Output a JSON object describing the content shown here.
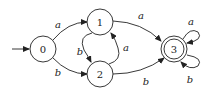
{
  "diagram": {
    "type": "finite-automaton",
    "start_state": "0",
    "accepting_states": [
      "3"
    ],
    "nodes": [
      {
        "id": "0",
        "label": "0"
      },
      {
        "id": "1",
        "label": "1"
      },
      {
        "id": "2",
        "label": "2"
      },
      {
        "id": "3",
        "label": "3"
      }
    ],
    "edges": [
      {
        "from": "0",
        "to": "1",
        "label": "a"
      },
      {
        "from": "0",
        "to": "2",
        "label": "b"
      },
      {
        "from": "1",
        "to": "2",
        "label": "b"
      },
      {
        "from": "2",
        "to": "1",
        "label": "a"
      },
      {
        "from": "1",
        "to": "3",
        "label": "a"
      },
      {
        "from": "2",
        "to": "3",
        "label": "b"
      },
      {
        "from": "3",
        "to": "3",
        "label": "a"
      },
      {
        "from": "3",
        "to": "3",
        "label": "b"
      }
    ]
  }
}
